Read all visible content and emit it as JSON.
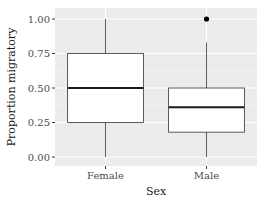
{
  "chart_data": {
    "type": "boxplot",
    "title": "",
    "xlabel": "Sex",
    "ylabel": "Proportion migratory",
    "ylim": [
      -0.04,
      1.04
    ],
    "yticks": [
      0.0,
      0.25,
      0.5,
      0.75,
      1.0
    ],
    "ytick_labels": [
      "0.00",
      "0.25",
      "0.50",
      "0.75",
      "1.00"
    ],
    "categories": [
      "Female",
      "Male"
    ],
    "grid": true,
    "legend": "none",
    "boxes": [
      {
        "category": "Female",
        "whisker_low": 0.0,
        "q1": 0.25,
        "median": 0.5,
        "q3": 0.75,
        "whisker_high": 1.0,
        "outliers": []
      },
      {
        "category": "Male",
        "whisker_low": 0.0,
        "q1": 0.18,
        "median": 0.36,
        "q3": 0.5,
        "whisker_high": 0.83,
        "outliers": [
          1.0
        ]
      }
    ]
  },
  "colors": {
    "panel_background": "#ebebeb",
    "grid_major": "#ffffff",
    "grid_minor": "#f5f5f5",
    "box_fill": "#ffffff",
    "box_line": "#333333",
    "median_line": "#1a1a1a",
    "outlier": "#000000"
  }
}
